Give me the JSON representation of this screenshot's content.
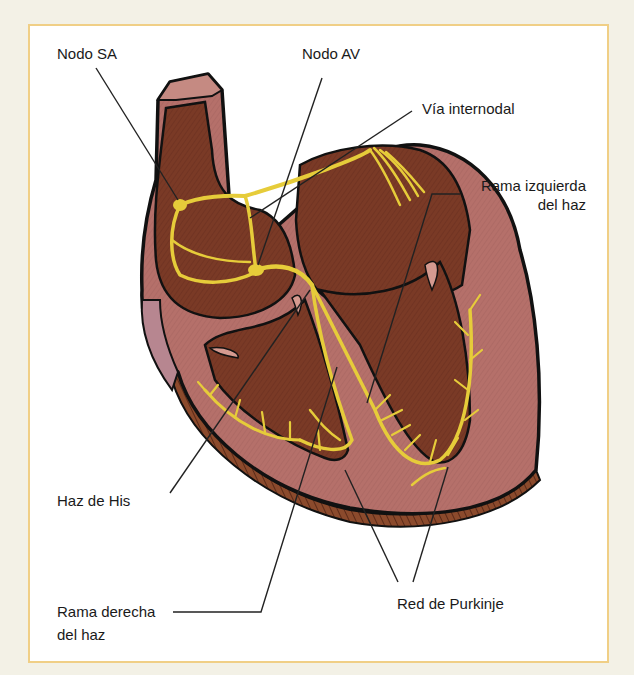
{
  "diagram": {
    "colors": {
      "page_background": "#f3f1e6",
      "panel_background": "#ffffff",
      "panel_border": "#f0cf86",
      "outer_wall": "#b5706a",
      "chamber": "#7a3a26",
      "conduction": "#e6cc3a",
      "outline": "#111111",
      "leader_line": "#222222"
    },
    "labels": [
      {
        "id": "nodo-sa",
        "text": "Nodo SA",
        "x": 57,
        "y": 44
      },
      {
        "id": "nodo-av",
        "text": "Nodo AV",
        "x": 302,
        "y": 44
      },
      {
        "id": "via-internodal",
        "text": "Vía internodal",
        "x": 422,
        "y": 99
      },
      {
        "id": "rama-izquierda",
        "line1": "Rama izquierda",
        "line2": "del haz",
        "x": 466,
        "y": 176
      },
      {
        "id": "haz-de-his",
        "text": "Haz de His",
        "x": 57,
        "y": 491
      },
      {
        "id": "rama-derecha",
        "line1": "Rama derecha",
        "line2": "del haz",
        "x": 57,
        "y": 600
      },
      {
        "id": "red-purkinje",
        "text": "Red de Purkinje",
        "x": 397,
        "y": 594
      }
    ]
  }
}
